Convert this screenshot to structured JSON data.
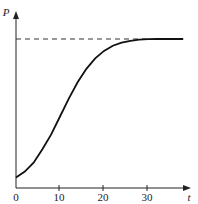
{
  "chart_data": {
    "type": "line",
    "title": "",
    "xlabel": "t",
    "ylabel": "P",
    "xlim": [
      0,
      40
    ],
    "x_ticks": [
      "0",
      "10",
      "20",
      "30"
    ],
    "y_ticks": [],
    "grid": false,
    "legend": null,
    "annotations": [
      "dashed horizontal asymptote at carrying capacity"
    ],
    "series": [
      {
        "name": "P(t) logistic curve",
        "x": [
          0,
          2,
          4,
          6,
          8,
          10,
          12,
          14,
          16,
          18,
          20,
          22,
          24,
          26,
          28,
          30,
          32,
          34,
          36,
          38
        ],
        "values": [
          0.07,
          0.11,
          0.17,
          0.26,
          0.36,
          0.48,
          0.6,
          0.71,
          0.8,
          0.87,
          0.92,
          0.955,
          0.975,
          0.988,
          0.995,
          0.999,
          1.0,
          1.0,
          1.0,
          1.0
        ]
      }
    ],
    "asymptote": {
      "value": 1.0,
      "style": "dashed"
    }
  },
  "labels": {
    "x_axis": "t",
    "y_axis": "P",
    "ticks": [
      "0",
      "10",
      "20",
      "30"
    ]
  }
}
